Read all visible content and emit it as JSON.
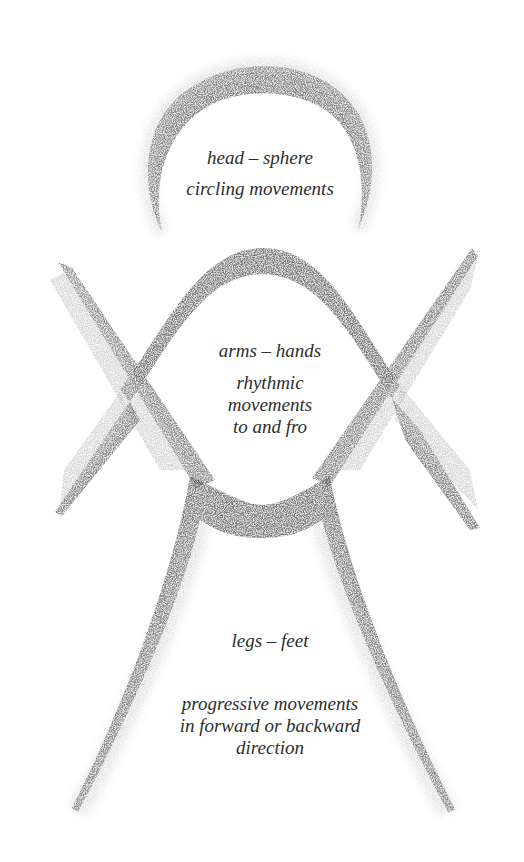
{
  "figure": {
    "colors": {
      "background": "#ffffff",
      "pencil_dark": "#3a3a3a",
      "pencil_mid": "#7a7a7a",
      "pencil_light": "#b8b8b8",
      "text": "#2e2e2e"
    },
    "head": {
      "title": "head – sphere",
      "description": "circling movements"
    },
    "arms": {
      "title": "arms – hands",
      "description": "rhythmic\nmovements\nto and fro"
    },
    "legs": {
      "title": "legs – feet",
      "description": "progressive movements\nin forward or backward\ndirection"
    }
  }
}
